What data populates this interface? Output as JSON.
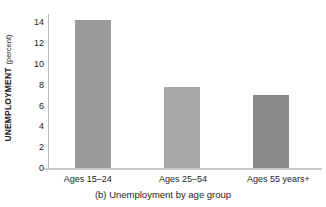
{
  "figure": {
    "caption": "(b) Unemployment by age group",
    "y_axis_title_strong": "UNEMPLOYMENT",
    "y_axis_title_light": "(percent)"
  },
  "chart_data": {
    "type": "bar",
    "title": "(b) Unemployment by age group",
    "categories": [
      "Ages 15–24",
      "Ages 25–54",
      "Ages 55 years+"
    ],
    "values": [
      14.2,
      7.8,
      7.0
    ],
    "xlabel": "",
    "ylabel": "UNEMPLOYMENT (percent)",
    "ylim": [
      0,
      15
    ],
    "yticks": [
      0,
      2,
      4,
      6,
      8,
      10,
      12,
      14
    ],
    "ytick_labels": [
      "0",
      "2",
      "4",
      "6",
      "8",
      "10",
      "12",
      "14"
    ],
    "grid": false,
    "legend": false,
    "bar_colors": [
      "#9b9b9b",
      "#a9a9a9",
      "#8a8a8a"
    ],
    "axis_color": "#c9c9c9",
    "text_color": "#1c1c1c"
  }
}
